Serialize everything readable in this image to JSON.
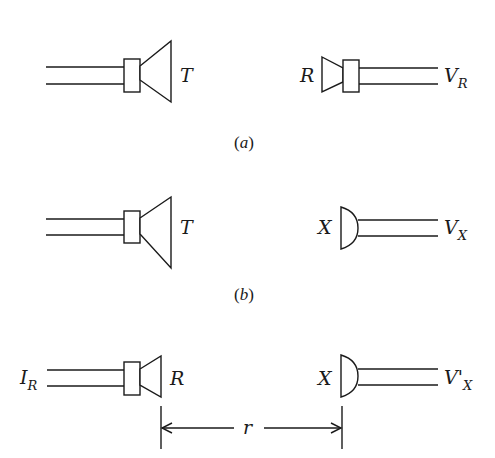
{
  "figure": {
    "panels": [
      {
        "id": "a",
        "caption": "(a)",
        "left": {
          "type": "transmitter-horn",
          "label": "T"
        },
        "right": {
          "type": "receiver-horn",
          "label": "R",
          "output": "V",
          "output_sub": "R"
        }
      },
      {
        "id": "b",
        "caption": "(b)",
        "left": {
          "type": "transmitter-horn",
          "label": "T"
        },
        "right": {
          "type": "microphone-dome",
          "label": "X",
          "output": "V",
          "output_sub": "X"
        }
      },
      {
        "id": "c",
        "left": {
          "type": "reciprocal-horn",
          "label": "R",
          "input": "I",
          "input_sub": "R"
        },
        "right": {
          "type": "microphone-dome",
          "label": "X",
          "output": "V'",
          "output_sub": "X"
        },
        "dimension": {
          "label": "r"
        }
      }
    ]
  },
  "colors": {
    "ink": "#1a1a1a",
    "background": "#ffffff"
  }
}
